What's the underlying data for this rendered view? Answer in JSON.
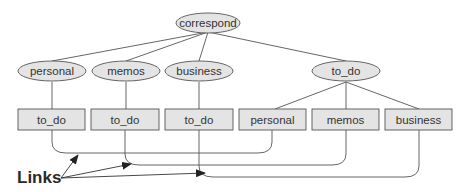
{
  "diagram": {
    "type": "tree-with-links",
    "colors": {
      "node_fill": "#e4e4e4",
      "node_stroke": "#555555",
      "line": "#555555",
      "text": "#333333"
    },
    "root": {
      "label": "correspond"
    },
    "level2": [
      {
        "label": "personal"
      },
      {
        "label": "memos"
      },
      {
        "label": "business"
      },
      {
        "label": "to_do"
      }
    ],
    "leaves": [
      {
        "label": "to_do",
        "parent": "personal"
      },
      {
        "label": "to_do",
        "parent": "memos"
      },
      {
        "label": "to_do",
        "parent": "business"
      },
      {
        "label": "personal",
        "parent": "to_do"
      },
      {
        "label": "memos",
        "parent": "to_do"
      },
      {
        "label": "business",
        "parent": "to_do"
      }
    ],
    "links": [
      {
        "from": "personal/to_do",
        "to": "to_do/personal"
      },
      {
        "from": "memos/to_do",
        "to": "to_do/memos"
      },
      {
        "from": "business/to_do",
        "to": "to_do/business"
      }
    ],
    "annotation": {
      "label": "Links"
    }
  }
}
